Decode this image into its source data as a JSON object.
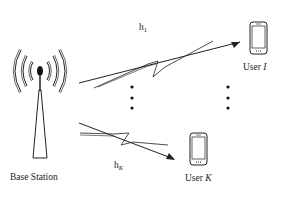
{
  "diagram": {
    "base_station": {
      "label": "Base Station",
      "icon": "antenna-tower-icon"
    },
    "users": [
      {
        "label": "User ",
        "index": "I",
        "icon": "smartphone-icon"
      },
      {
        "label": "User ",
        "index": "K",
        "icon": "smartphone-icon"
      }
    ],
    "channels": [
      {
        "label": "h",
        "subscript": "1"
      },
      {
        "label": "h",
        "subscript": "K"
      }
    ],
    "ellipsis": "⋮",
    "colors": {
      "stroke": "#222222",
      "background": "#ffffff"
    }
  }
}
